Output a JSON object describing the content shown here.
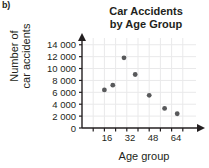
{
  "part_label": "b)",
  "chart_data": {
    "type": "scatter",
    "title": "Car Accidents by Age Group",
    "title_lines": [
      "Car Accidents",
      "by Age Group"
    ],
    "xlabel": "Age group",
    "ylabel": "Number of car accidents",
    "ylabel_lines": [
      "Number of",
      "car accidents"
    ],
    "x": [
      16,
      22,
      30,
      38,
      48,
      59,
      68
    ],
    "values": [
      6400,
      7200,
      11800,
      9000,
      5500,
      3300,
      2400
    ],
    "points": [
      {
        "x": 16,
        "y": 6400
      },
      {
        "x": 22,
        "y": 7200
      },
      {
        "x": 30,
        "y": 11800
      },
      {
        "x": 38,
        "y": 9000
      },
      {
        "x": 48,
        "y": 5500
      },
      {
        "x": 59,
        "y": 3300
      },
      {
        "x": 68,
        "y": 2400
      }
    ],
    "xlim": [
      0,
      80
    ],
    "ylim": [
      0,
      14800
    ],
    "xticks": [
      16,
      32,
      48,
      64
    ],
    "xtick_labels": [
      "16",
      "32",
      "48",
      "64"
    ],
    "yticks": [
      0,
      2000,
      4000,
      6000,
      8000,
      10000,
      12000,
      14000
    ],
    "ytick_labels": [
      "0",
      "2 000",
      "4 000",
      "6 000",
      "8 000",
      "10 000",
      "12 000",
      "14 000"
    ],
    "grid": true,
    "legend": null,
    "marker_color": "#58595b",
    "grid_color": "#e9e9ea",
    "axis_color": "#231f20"
  }
}
